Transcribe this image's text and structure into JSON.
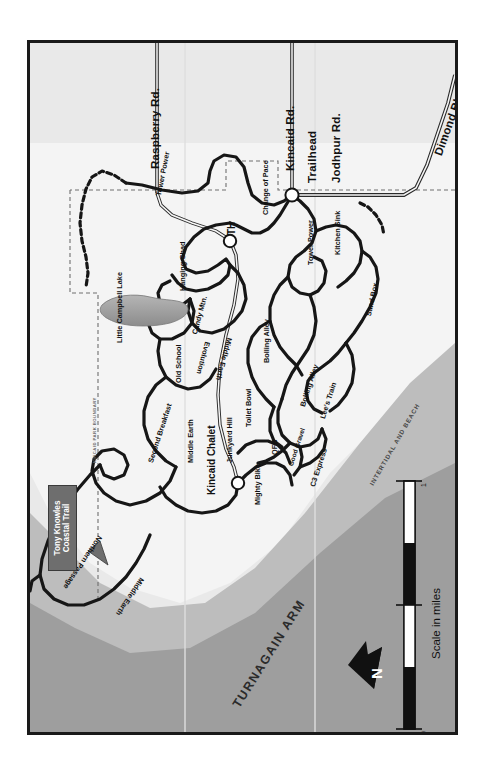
{
  "map": {
    "title": "Kincaid Park Trail Map",
    "orientation_note": "map rotated 90 degrees; labels read bottom-to-top",
    "background_color": "#e8e8e8",
    "land_color": "#f2f2f2",
    "water_color": "#9a9a9a",
    "intertidal_color": "#b8b8b8",
    "trail_color": "#1a1a1a",
    "border_color": "#1a1a1a"
  },
  "roads": [
    {
      "name": "Raspberry Rd."
    },
    {
      "name": "Kincaid Rd."
    },
    {
      "name": "Jodhpur Rd."
    },
    {
      "name": "Dimond Blvd."
    }
  ],
  "places": [
    {
      "name": "Trailhead"
    },
    {
      "name": "TH"
    },
    {
      "name": "Kincaid Chalet"
    },
    {
      "name": "Little Campbell Lake"
    }
  ],
  "trails": [
    {
      "name": "Tower Power"
    },
    {
      "name": "Change of Pace"
    },
    {
      "name": "Hanging Chad"
    },
    {
      "name": "Candy Mtn."
    },
    {
      "name": "Old School"
    },
    {
      "name": "Second Breakfast"
    },
    {
      "name": "Middle Earth"
    },
    {
      "name": "Evolution"
    },
    {
      "name": "Middle Earth"
    },
    {
      "name": "Junkyard Hill"
    },
    {
      "name": "Mighty Bike"
    },
    {
      "name": "Northern Passage"
    },
    {
      "name": "Middle Earth"
    },
    {
      "name": "Tower Power"
    },
    {
      "name": "Kitchen Sink"
    },
    {
      "name": "Sand Box"
    },
    {
      "name": "Bolling Alley"
    },
    {
      "name": "Bolling Alley"
    },
    {
      "name": "Toilet Bowl"
    },
    {
      "name": "Lee's Train"
    },
    {
      "name": "QFB"
    },
    {
      "name": "Good Gravel"
    },
    {
      "name": "C3 Express"
    }
  ],
  "callout": {
    "line1": "Tony Knowles",
    "line2": "Coastal Trail"
  },
  "zones": [
    {
      "name": "TURNAGAIN ARM"
    },
    {
      "name": "INTERTIDAL AND BEACH"
    },
    {
      "name": "KINCAID PARK BOUNDARY"
    }
  ],
  "compass": {
    "label": "N"
  },
  "scale": {
    "caption": "Scale in miles",
    "min": "0",
    "max": "1"
  }
}
